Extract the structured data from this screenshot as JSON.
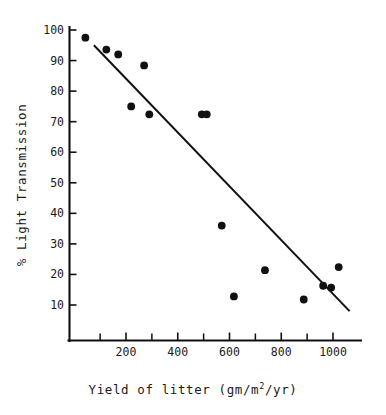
{
  "figure": {
    "background_color": "#ffffff",
    "ink_color": "#111111",
    "width": 386,
    "height": 415
  },
  "chart_data": {
    "type": "scatter",
    "title": "",
    "subtitle": "",
    "xlabel": "Yield of litter (gm/m2/yr)",
    "xlabel_parts": {
      "before": "Yield of litter (gm/m",
      "superscript": "2",
      "after": "/yr)"
    },
    "ylabel": "% Light Transmission",
    "xlim": [
      0,
      1090
    ],
    "ylim": [
      5,
      101
    ],
    "grid": false,
    "legend": null,
    "legend_position": "none",
    "xticks": [
      200,
      400,
      600,
      800,
      1000
    ],
    "xtick_labels": [
      "200",
      "400",
      "600",
      "800",
      "1000"
    ],
    "xticks_minor": [
      100,
      300,
      500,
      700,
      900
    ],
    "yticks": [
      10,
      20,
      30,
      40,
      50,
      60,
      70,
      80,
      90,
      100
    ],
    "ytick_labels": [
      "10",
      "20",
      "30",
      "40",
      "50",
      "60",
      "70",
      "80",
      "90",
      "100"
    ],
    "points": [
      {
        "x": 43,
        "y": 97.5
      },
      {
        "x": 124,
        "y": 93.6
      },
      {
        "x": 170,
        "y": 92.0
      },
      {
        "x": 270,
        "y": 88.4
      },
      {
        "x": 220,
        "y": 75.0
      },
      {
        "x": 290,
        "y": 72.4
      },
      {
        "x": 493,
        "y": 72.4
      },
      {
        "x": 512,
        "y": 72.4
      },
      {
        "x": 570,
        "y": 36.0
      },
      {
        "x": 737,
        "y": 21.4
      },
      {
        "x": 617,
        "y": 12.8
      },
      {
        "x": 887,
        "y": 11.8
      },
      {
        "x": 962,
        "y": 16.3
      },
      {
        "x": 993,
        "y": 15.7
      },
      {
        "x": 1022,
        "y": 22.4
      }
    ],
    "series": [
      {
        "name": "Light transmission vs litter yield",
        "marker": "filled-circle",
        "marker_color": "#111111",
        "marker_size": 5.4
      }
    ],
    "trendline": {
      "type": "linear-fit",
      "x_start": 76,
      "y_start": 95.0,
      "x_end": 1064,
      "y_end": 8.0,
      "color": "#111111"
    }
  }
}
